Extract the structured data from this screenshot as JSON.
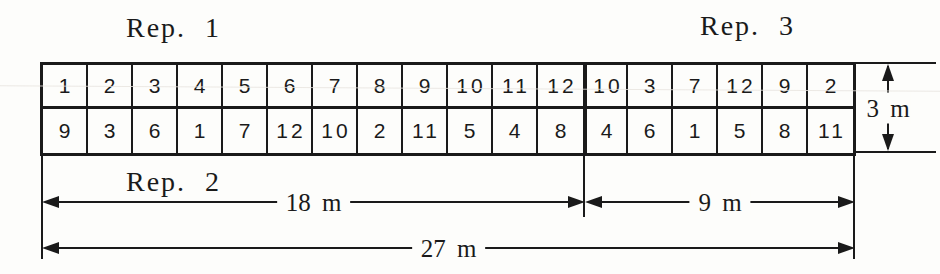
{
  "diagram": {
    "rep1_label": "Rep. 1",
    "rep2_label": "Rep. 2",
    "rep3_label": "Rep. 3",
    "plots": {
      "row1": [
        "1",
        "2",
        "3",
        "4",
        "5",
        "6",
        "7",
        "8",
        "9",
        "10",
        "11",
        "12",
        "10",
        "3",
        "7",
        "12",
        "9",
        "2"
      ],
      "row2": [
        "9",
        "3",
        "6",
        "1",
        "7",
        "12",
        "10",
        "2",
        "11",
        "5",
        "4",
        "8",
        "4",
        "6",
        "1",
        "5",
        "8",
        "11"
      ]
    },
    "dimensions": {
      "rep1_2_width": "18 m",
      "rep3_width": "9 m",
      "total_width": "27 m",
      "plot_height": "3 m"
    },
    "colors": {
      "ink": "#1a1a1a",
      "paper": "#fdfdfb"
    }
  }
}
